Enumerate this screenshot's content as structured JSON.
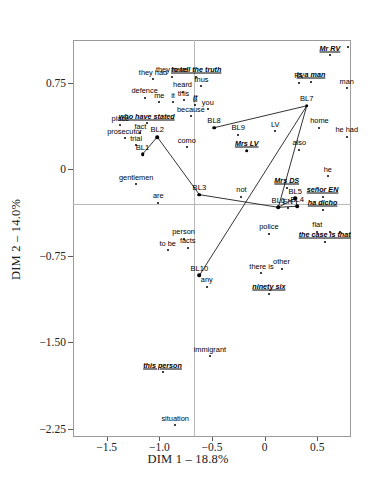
{
  "chart_data": {
    "type": "scatter",
    "title": "",
    "xlabel": "DIM 1 – 18.8%",
    "ylabel": "DIM 2 – 14.0%",
    "xlim": [
      -1.82,
      0.82
    ],
    "ylim": [
      -2.32,
      1.12
    ],
    "xticks": [
      "-1.5",
      "-1.0",
      "-0.5",
      "0",
      "0.5"
    ],
    "xtickvalues": [
      -1.5,
      -1.0,
      -0.5,
      0,
      0.5
    ],
    "yticks": [
      "0.75",
      "0",
      "-0.75",
      "-1.50",
      "-2.25"
    ],
    "ytickvalues": [
      0.75,
      0,
      -0.75,
      -1.5,
      -2.25
    ],
    "grid": false,
    "legend": null,
    "reference_lines": {
      "x": 0,
      "y": 0
    },
    "points": [
      {
        "label": "Mr RV",
        "x": 0.62,
        "y": 0.99,
        "style": "emph"
      },
      {
        "label": "",
        "x": 0.79,
        "y": 1.06,
        "style": "plain"
      },
      {
        "label": "is a man",
        "x": 0.44,
        "y": 0.76,
        "style": "emph"
      },
      {
        "label": "RV",
        "x": 0.33,
        "y": 0.75,
        "style": "plain"
      },
      {
        "label": "man",
        "x": 0.78,
        "y": 0.7,
        "style": "plain"
      },
      {
        "label": "they had",
        "x": -1.06,
        "y": 0.78,
        "style": "plain"
      },
      {
        "label": "they have",
        "x": -0.88,
        "y": 0.8,
        "style": "plain"
      },
      {
        "label": "to tell the truth",
        "x": -0.65,
        "y": 0.8,
        "style": "emph"
      },
      {
        "label": "thus",
        "x": -0.6,
        "y": 0.72,
        "style": "plain"
      },
      {
        "label": "defence",
        "x": -1.14,
        "y": 0.62,
        "style": "plain"
      },
      {
        "label": "heard",
        "x": -0.78,
        "y": 0.67,
        "style": "plain"
      },
      {
        "label": "me",
        "x": -1.0,
        "y": 0.58,
        "style": "plain"
      },
      {
        "label": "it",
        "x": -0.87,
        "y": 0.58,
        "style": "plain"
      },
      {
        "label": "this",
        "x": -0.77,
        "y": 0.6,
        "style": "plain"
      },
      {
        "label": "it",
        "x": -0.66,
        "y": 0.56,
        "style": "emph"
      },
      {
        "label": "you",
        "x": -0.54,
        "y": 0.52,
        "style": "plain"
      },
      {
        "label": "because",
        "x": -0.7,
        "y": 0.46,
        "style": "plain"
      },
      {
        "label": "who have stated",
        "x": -1.12,
        "y": 0.4,
        "style": "emph"
      },
      {
        "label": "place",
        "x": -1.37,
        "y": 0.38,
        "style": "plain"
      },
      {
        "label": "BL8",
        "x": -0.48,
        "y": 0.36,
        "style": "code",
        "node": true
      },
      {
        "label": "home",
        "x": 0.52,
        "y": 0.36,
        "style": "plain"
      },
      {
        "label": "fact",
        "x": -1.18,
        "y": 0.31,
        "style": "plain"
      },
      {
        "label": "prosecutor",
        "x": -1.33,
        "y": 0.27,
        "style": "plain"
      },
      {
        "label": "BL9",
        "x": -0.25,
        "y": 0.3,
        "style": "code"
      },
      {
        "label": "LV",
        "x": 0.1,
        "y": 0.33,
        "style": "plain"
      },
      {
        "label": "he had",
        "x": 0.78,
        "y": 0.28,
        "style": "plain"
      },
      {
        "label": "trial",
        "x": -1.22,
        "y": 0.21,
        "style": "plain"
      },
      {
        "label": "BL2",
        "x": -1.02,
        "y": 0.28,
        "style": "code",
        "node": true
      },
      {
        "label": "como",
        "x": -0.74,
        "y": 0.19,
        "style": "plain"
      },
      {
        "label": "BL1",
        "x": -1.16,
        "y": 0.13,
        "style": "code",
        "node": true
      },
      {
        "label": "Mrs LV",
        "x": -0.17,
        "y": 0.16,
        "style": "emph",
        "node": true
      },
      {
        "label": "also",
        "x": 0.33,
        "y": 0.17,
        "style": "plain"
      },
      {
        "label": "BL7",
        "x": 0.4,
        "y": 0.55,
        "style": "code",
        "node": true
      },
      {
        "label": "gentlemen",
        "x": -1.22,
        "y": -0.13,
        "style": "plain"
      },
      {
        "label": "he",
        "x": 0.6,
        "y": -0.06,
        "style": "plain"
      },
      {
        "label": "Mrs DS",
        "x": 0.21,
        "y": -0.16,
        "style": "emph"
      },
      {
        "label": "BL3",
        "x": -0.62,
        "y": -0.22,
        "style": "code",
        "node": true
      },
      {
        "label": "not",
        "x": -0.22,
        "y": -0.24,
        "style": "plain"
      },
      {
        "label": "BL5",
        "x": 0.29,
        "y": -0.25,
        "style": "code",
        "node": true
      },
      {
        "label": "señor EN",
        "x": 0.55,
        "y": -0.24,
        "style": "emph"
      },
      {
        "label": "are",
        "x": -1.01,
        "y": -0.29,
        "style": "plain"
      },
      {
        "label": "BL6",
        "x": 0.13,
        "y": -0.33,
        "style": "code",
        "node": true
      },
      {
        "label": "EN",
        "x": 0.22,
        "y": -0.34,
        "style": "plain"
      },
      {
        "label": "BL4",
        "x": 0.31,
        "y": -0.32,
        "style": "code",
        "node": true
      },
      {
        "label": "ha dicho",
        "x": 0.55,
        "y": -0.35,
        "style": "emph"
      },
      {
        "label": "police",
        "x": 0.04,
        "y": -0.56,
        "style": "plain"
      },
      {
        "label": "flat",
        "x": 0.5,
        "y": -0.54,
        "style": "plain"
      },
      {
        "label": "",
        "x": 0.62,
        "y": -0.54,
        "style": "plain"
      },
      {
        "label": "",
        "x": 0.72,
        "y": -0.54,
        "style": "plain"
      },
      {
        "label": "person",
        "x": -0.77,
        "y": -0.6,
        "style": "plain"
      },
      {
        "label": "the case is that",
        "x": 0.57,
        "y": -0.63,
        "style": "emph"
      },
      {
        "label": "to be",
        "x": -0.92,
        "y": -0.7,
        "style": "plain"
      },
      {
        "label": "facts",
        "x": -0.73,
        "y": -0.68,
        "style": "plain"
      },
      {
        "label": "BL10",
        "x": -0.62,
        "y": -0.92,
        "style": "code",
        "node": true
      },
      {
        "label": "there is",
        "x": -0.03,
        "y": -0.9,
        "style": "plain"
      },
      {
        "label": "other",
        "x": 0.16,
        "y": -0.86,
        "style": "plain"
      },
      {
        "label": "any",
        "x": -0.55,
        "y": -1.02,
        "style": "plain"
      },
      {
        "label": "ninety six",
        "x": 0.04,
        "y": -1.08,
        "style": "emph"
      },
      {
        "label": "immigrant",
        "x": -0.52,
        "y": -1.62,
        "style": "plain"
      },
      {
        "label": "this person",
        "x": -0.97,
        "y": -1.76,
        "style": "emph"
      },
      {
        "label": "situation",
        "x": -0.85,
        "y": -2.22,
        "style": "plain"
      }
    ],
    "links": [
      {
        "from": "BL1",
        "to": "BL2"
      },
      {
        "from": "BL2",
        "to": "BL3"
      },
      {
        "from": "BL3",
        "to": "BL6"
      },
      {
        "from": "BL8",
        "to": "BL9"
      },
      {
        "from": "BL8",
        "to": "BL7"
      },
      {
        "from": "BL9",
        "to": "BL7"
      },
      {
        "from": "BL7",
        "to": "BL6"
      },
      {
        "from": "BL7",
        "to": "BL10"
      },
      {
        "from": "BL6",
        "to": "BL5"
      },
      {
        "from": "BL6",
        "to": "BL4"
      },
      {
        "from": "BL5",
        "to": "BL4"
      }
    ]
  }
}
